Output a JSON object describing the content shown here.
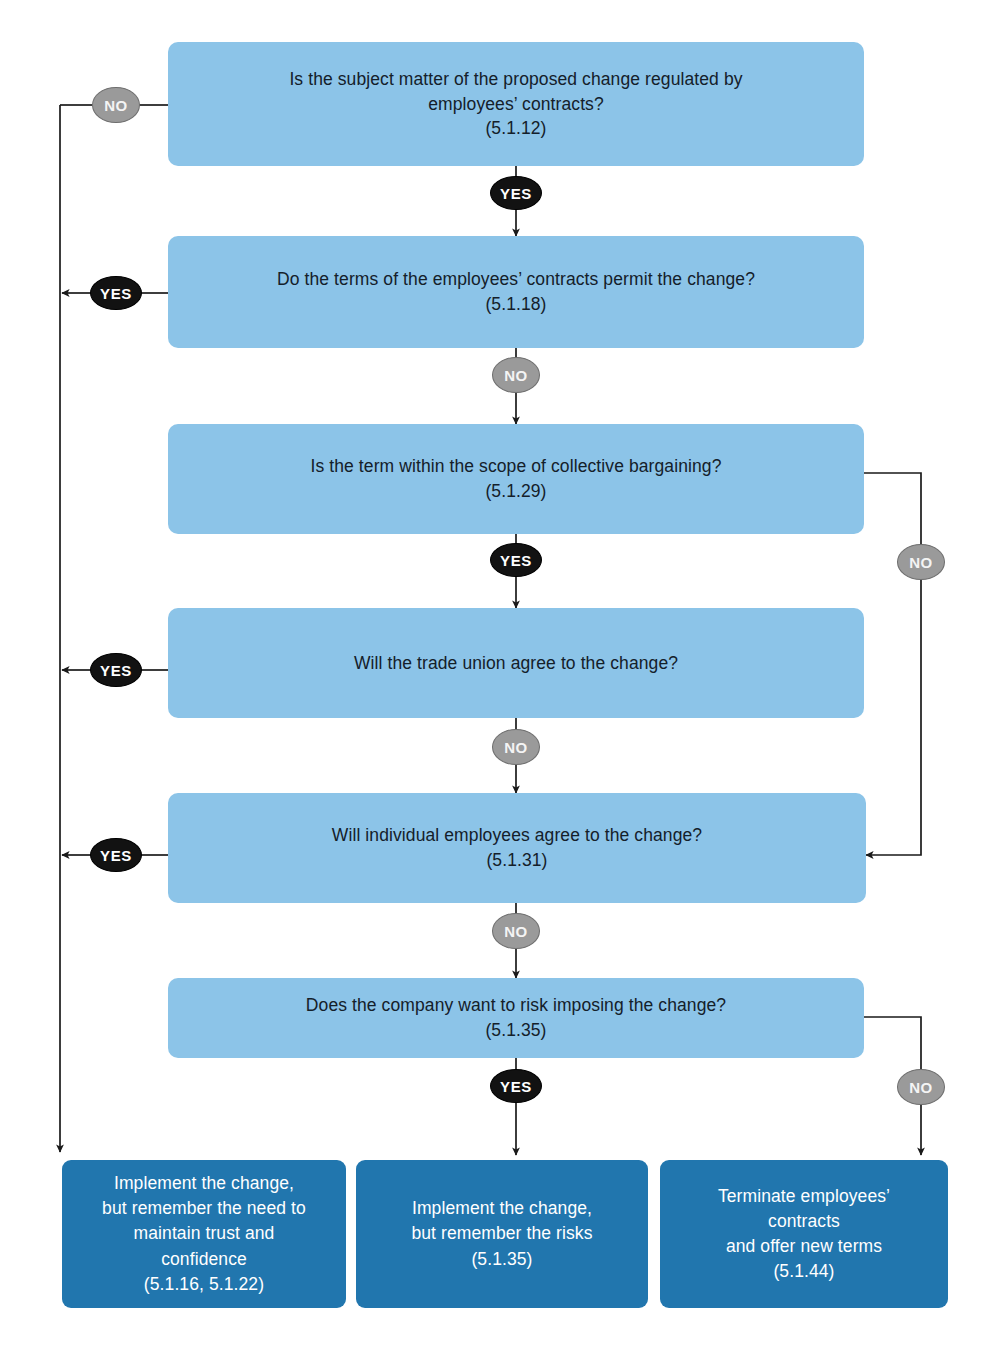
{
  "diagram": {
    "title_fragment": "",
    "colors": {
      "decision_fill": "#8cc4e8",
      "terminal_fill": "#2176ae",
      "yes_badge_fill": "#121212",
      "no_badge_fill": "#9a9a9a",
      "connector": "#1a1a1a",
      "decision_text": "#14202a",
      "terminal_text": "#ffffff"
    },
    "decisions": [
      {
        "id": "d1",
        "text": "Is the subject matter of the proposed change regulated by\nemployees’ contracts?\n(5.1.12)",
        "ref": "(5.1.12)"
      },
      {
        "id": "d2",
        "text": "Do the terms of the employees’ contracts permit the change?\n(5.1.18)",
        "ref": "(5.1.18)"
      },
      {
        "id": "d3",
        "text": "Is the term within the scope of collective bargaining?\n(5.1.29)",
        "ref": "(5.1.29)"
      },
      {
        "id": "d4",
        "text": "Will the trade union agree to the change?",
        "ref": ""
      },
      {
        "id": "d5",
        "text": "Will individual employees agree to the change?\n(5.1.31)",
        "ref": "(5.1.31)"
      },
      {
        "id": "d6",
        "text": "Does the company want to risk imposing the change?\n(5.1.35)",
        "ref": "(5.1.35)"
      }
    ],
    "terminals": [
      {
        "id": "t1",
        "text": "Implement the change,\nbut remember the need to\nmaintain trust and\nconfidence\n(5.1.16, 5.1.22)",
        "ref": "(5.1.16, 5.1.22)"
      },
      {
        "id": "t2",
        "text": "Implement the change,\nbut remember the risks\n(5.1.35)",
        "ref": "(5.1.35)"
      },
      {
        "id": "t3",
        "text": "Terminate employees’\ncontracts\nand offer new terms\n(5.1.44)",
        "ref": "(5.1.44)"
      }
    ],
    "badges": [
      {
        "id": "b1",
        "label": "NO",
        "kind": "no",
        "from": "d1",
        "to": "t1"
      },
      {
        "id": "b2",
        "label": "YES",
        "kind": "yes",
        "from": "d1",
        "to": "d2"
      },
      {
        "id": "b3",
        "label": "YES",
        "kind": "yes",
        "from": "d2",
        "to": "t1"
      },
      {
        "id": "b4",
        "label": "NO",
        "kind": "no",
        "from": "d2",
        "to": "d3"
      },
      {
        "id": "b5",
        "label": "NO",
        "kind": "no",
        "from": "d3",
        "to": "d5"
      },
      {
        "id": "b6",
        "label": "YES",
        "kind": "yes",
        "from": "d3",
        "to": "d4"
      },
      {
        "id": "b7",
        "label": "YES",
        "kind": "yes",
        "from": "d4",
        "to": "t1"
      },
      {
        "id": "b8",
        "label": "NO",
        "kind": "no",
        "from": "d4",
        "to": "d5"
      },
      {
        "id": "b9",
        "label": "YES",
        "kind": "yes",
        "from": "d5",
        "to": "t1"
      },
      {
        "id": "b10",
        "label": "NO",
        "kind": "no",
        "from": "d5",
        "to": "d6"
      },
      {
        "id": "b11",
        "label": "YES",
        "kind": "yes",
        "from": "d6",
        "to": "t2"
      },
      {
        "id": "b12",
        "label": "NO",
        "kind": "no",
        "from": "d6",
        "to": "t3"
      }
    ]
  }
}
